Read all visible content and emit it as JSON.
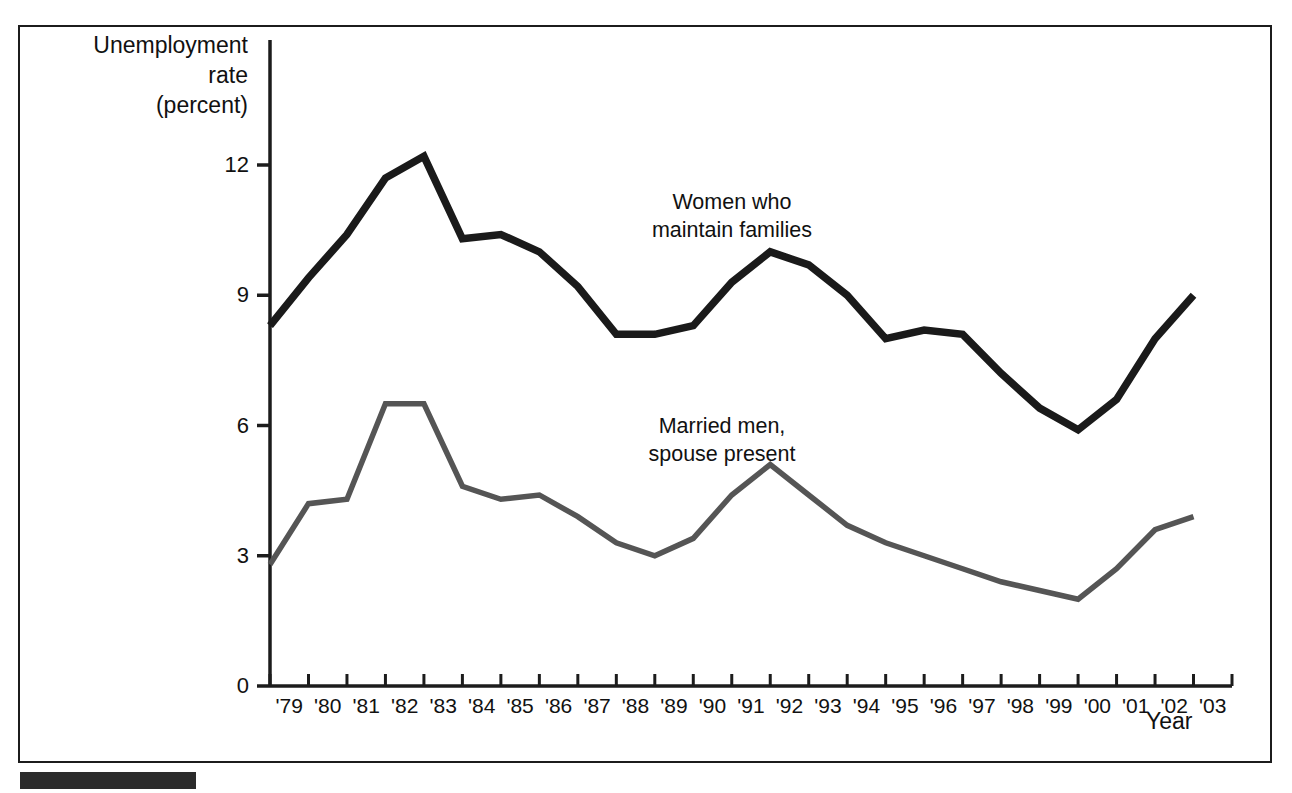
{
  "chart_data": {
    "type": "line",
    "title": "",
    "xlabel": "Year",
    "ylabel": "Unemployment\nrate\n(percent)",
    "ylabel_lines": [
      "Unemployment",
      "rate",
      "(percent)"
    ],
    "x": [
      "'79",
      "'80",
      "'81",
      "'82",
      "'83",
      "'84",
      "'85",
      "'86",
      "'87",
      "'88",
      "'89",
      "'90",
      "'91",
      "'92",
      "'93",
      "'94",
      "'95",
      "'96",
      "'97",
      "'98",
      "'99",
      "'00",
      "'01",
      "'02",
      "'03"
    ],
    "xtick_labels": [
      "'79",
      "'80",
      "'81",
      "'82",
      "'83",
      "'84",
      "'85",
      "'86",
      "'87",
      "'88",
      "'89",
      "'90",
      "'91",
      "'92",
      "'93",
      "'94",
      "'95",
      "'96",
      "'97",
      "'98",
      "'99",
      "'00",
      "'01",
      "'02",
      "'03"
    ],
    "ytick_labels": [
      "0",
      "3",
      "6",
      "9",
      "12"
    ],
    "yticks": [
      0,
      3,
      6,
      9,
      12
    ],
    "ylim": [
      0,
      13.5
    ],
    "grid": false,
    "legend_position": "inline-annotation",
    "series": [
      {
        "name": "Women who maintain families",
        "label_lines": [
          "Women who",
          "maintain families"
        ],
        "color": "#1a1a1a",
        "values": [
          8.3,
          9.4,
          10.4,
          11.7,
          12.2,
          10.3,
          10.4,
          10.0,
          9.2,
          8.1,
          8.1,
          8.3,
          9.3,
          10.0,
          9.7,
          9.0,
          8.0,
          8.2,
          8.1,
          7.2,
          6.4,
          5.9,
          6.6,
          8.0,
          9.0
        ]
      },
      {
        "name": "Married men, spouse present",
        "label_lines": [
          "Married men,",
          "spouse present"
        ],
        "color": "#555555",
        "values": [
          2.8,
          4.2,
          4.3,
          6.5,
          6.5,
          4.6,
          4.3,
          4.4,
          3.9,
          3.3,
          3.0,
          3.4,
          4.4,
          5.1,
          4.4,
          3.7,
          3.3,
          3.0,
          2.7,
          2.4,
          2.2,
          2.0,
          2.7,
          3.6,
          3.9
        ]
      }
    ]
  },
  "axis": {
    "y_title_line1": "Unemployment",
    "y_title_line2": "rate",
    "y_title_line3": "(percent)",
    "x_title": "Year"
  },
  "annotations": {
    "women_line1": "Women who",
    "women_line2": "maintain families",
    "married_line1": "Married men,",
    "married_line2": "spouse present"
  },
  "colors": {
    "series_women": "#1a1a1a",
    "series_married": "#555555",
    "frame": "#1c1c1c",
    "footer_bar": "#2b2b2b",
    "background": "#ffffff"
  }
}
